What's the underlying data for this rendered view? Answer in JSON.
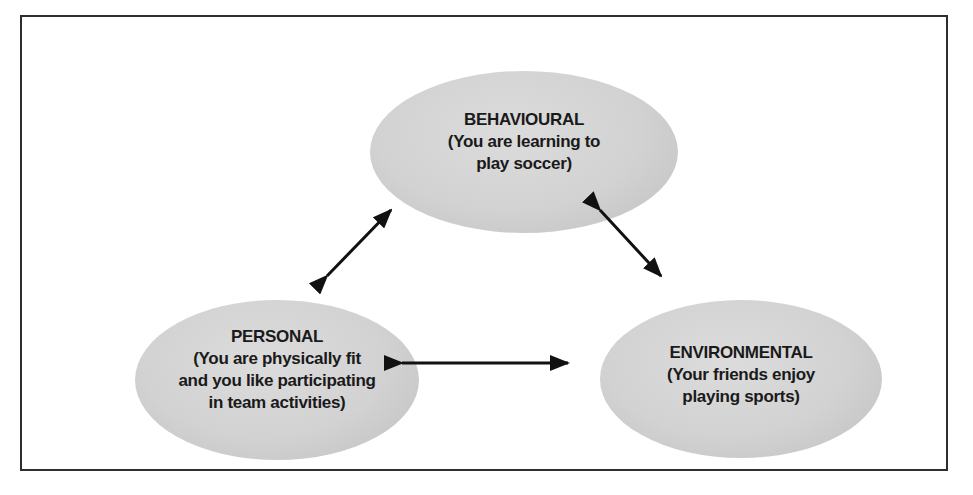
{
  "diagram": {
    "nodes": {
      "behavioural": {
        "title": "BEHAVIOURAL",
        "lines": [
          "(You are learning to",
          "play soccer)"
        ]
      },
      "personal": {
        "title": "PERSONAL",
        "lines": [
          "(You are physically fit",
          "and you like participating",
          "in team activities)"
        ]
      },
      "environmental": {
        "title": "ENVIRONMENTAL",
        "lines": [
          "(Your friends enjoy",
          "playing sports)"
        ]
      }
    },
    "connections": [
      {
        "from": "behavioural",
        "to": "personal",
        "bidirectional": true
      },
      {
        "from": "behavioural",
        "to": "environmental",
        "bidirectional": true
      },
      {
        "from": "personal",
        "to": "environmental",
        "bidirectional": true
      }
    ]
  },
  "colors": {
    "ellipse_light": "#dcdcdc",
    "ellipse_mid": "#d2d2d2",
    "ellipse_dark": "#bfbfbf",
    "arrow_color": "#111111",
    "border_color": "#2e2e2e",
    "text_color": "#1a1a1a"
  }
}
